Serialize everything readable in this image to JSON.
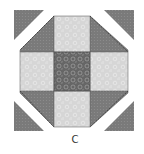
{
  "figure": {
    "caption": "C",
    "colors": {
      "dark_fabric": "#7a7a7a",
      "light_fabric": "#d9d9d9",
      "center_fabric": "#6a6a6a",
      "seam": "#4a4a4a",
      "background": "#ffffff"
    },
    "grid": {
      "rows": 3,
      "cols": 3
    },
    "patches": [
      {
        "row": 0,
        "col": 0,
        "type": "corner-triangle",
        "fabric": "dark"
      },
      {
        "row": 0,
        "col": 1,
        "type": "square",
        "fabric": "light"
      },
      {
        "row": 0,
        "col": 2,
        "type": "corner-triangle",
        "fabric": "dark"
      },
      {
        "row": 1,
        "col": 0,
        "type": "square",
        "fabric": "light"
      },
      {
        "row": 1,
        "col": 1,
        "type": "square",
        "fabric": "center-print"
      },
      {
        "row": 1,
        "col": 2,
        "type": "square",
        "fabric": "light"
      },
      {
        "row": 2,
        "col": 0,
        "type": "corner-triangle",
        "fabric": "dark"
      },
      {
        "row": 2,
        "col": 1,
        "type": "square",
        "fabric": "light"
      },
      {
        "row": 2,
        "col": 2,
        "type": "corner-triangle",
        "fabric": "dark"
      }
    ],
    "detached_triangles": [
      "top-left",
      "top-right",
      "bottom-left",
      "bottom-right"
    ]
  }
}
